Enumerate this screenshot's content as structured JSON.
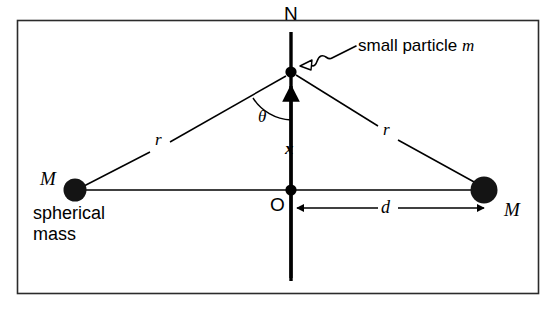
{
  "figure": {
    "frame_color": "#1a1a1a",
    "ink_color": "#000000",
    "background_color": "#ffffff",
    "labels": {
      "top_point": "N",
      "origin_point": "O",
      "left_mass": "M",
      "right_mass": "M",
      "left_mass_caption_line1": "spherical",
      "left_mass_caption_line2": "mass",
      "left_radius": "r",
      "right_radius": "r",
      "angle": "θ",
      "displacement": "x",
      "separation": "d",
      "particle_annotation_text": "small particle ",
      "particle_annotation_symbol": "m"
    },
    "geometry": {
      "frame": {
        "x": 17,
        "y": 20,
        "width": 522,
        "height": 274
      },
      "vertical_axis": {
        "x": 291,
        "y_top": 32,
        "y_bottom": 281
      },
      "particle_point": {
        "x": 291,
        "y": 72,
        "radius": 5.5
      },
      "origin": {
        "x": 291,
        "y": 190,
        "radius": 5.5
      },
      "left_mass": {
        "x": 75,
        "y": 190,
        "radius": 11.5
      },
      "right_mass": {
        "x": 484,
        "y": 190,
        "radius": 13.5
      },
      "field_arrow": {
        "x": 291,
        "y_tail": 281,
        "y_head": 80
      },
      "separation_arrow": {
        "y": 208,
        "x_start": 294,
        "x_end": 486
      },
      "angle_arc_radius": 48
    }
  }
}
